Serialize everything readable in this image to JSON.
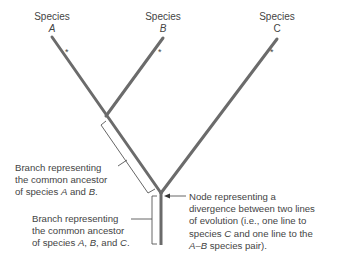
{
  "species": [
    {
      "label": "Species",
      "letter": "A"
    },
    {
      "label": "Species",
      "letter": "B"
    },
    {
      "label": "Species",
      "letter": "C"
    }
  ],
  "asterisk": "*",
  "annotations": {
    "ab_branch": {
      "line1": "Branch representing",
      "line2": "the common ancestor",
      "line3_prefix": "of species ",
      "line3_a": "A",
      "line3_mid": " and ",
      "line3_b": "B",
      "line3_suffix": "."
    },
    "abc_branch": {
      "line1": "Branch representing",
      "line2": "the common ancestor",
      "line3_prefix": "of species ",
      "line3_a": "A",
      "line3_sep1": ", ",
      "line3_b": "B",
      "line3_sep2": ", and ",
      "line3_c": "C",
      "line3_suffix": "."
    },
    "node": {
      "line1": "Node representing a",
      "line2": "divergence between two lines",
      "line3": "of evolution (i.e., one line to",
      "line4_prefix": "species ",
      "line4_c": "C",
      "line4_suffix": " and one line to the",
      "line5_ab": "A–B",
      "line5_suffix": " species pair)."
    }
  },
  "colors": {
    "branch": "#6b6b6b",
    "text": "#444444",
    "bracket": "#555555"
  }
}
